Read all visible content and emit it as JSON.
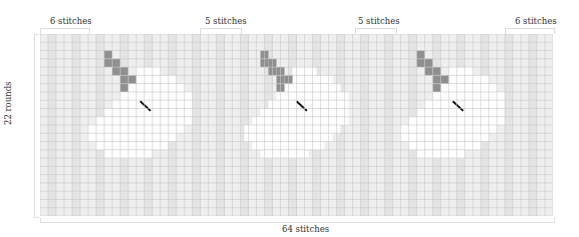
{
  "chart": {
    "columns": 64,
    "rows": 22,
    "column_label": "64 stitches",
    "row_label": "22 rounds",
    "top_brackets": [
      {
        "label": "6 stitches",
        "x": 40,
        "width": 48,
        "label_x": 50
      },
      {
        "label": "5 stitches",
        "x": 200,
        "width": 40,
        "label_x": 205
      },
      {
        "label": "5 stitches",
        "x": 355,
        "width": 40,
        "label_x": 358
      },
      {
        "label": "6 stitches",
        "x": 505,
        "width": 48,
        "label_x": 515
      }
    ],
    "colors": {
      "background_cell": "#efefef",
      "light_cell": "#e4e4e4",
      "white_cell": "#ffffff",
      "ear_cell": "#8f8f8f",
      "grid_line": "#c8c8c8",
      "stitch_mark": "#111111"
    },
    "motif_offsets": [
      0,
      19.5,
      39
    ],
    "ear_cells": [
      [
        8,
        2
      ],
      [
        8,
        3
      ],
      [
        9,
        3
      ],
      [
        9,
        4
      ],
      [
        10,
        4
      ],
      [
        10,
        5
      ],
      [
        11,
        5
      ],
      [
        10,
        6
      ]
    ],
    "stitch_mark": {
      "col": 12.5,
      "row": 8,
      "length_cells": 1.3
    },
    "white_cells_rows": [
      {
        "row": 4,
        "from": 12,
        "to": 14
      },
      {
        "row": 5,
        "from": 12,
        "to": 16
      },
      {
        "row": 6,
        "from": 11,
        "to": 17
      },
      {
        "row": 7,
        "from": 10,
        "to": 18
      },
      {
        "row": 8,
        "from": 9,
        "to": 18
      },
      {
        "row": 9,
        "from": 8,
        "to": 18
      },
      {
        "row": 10,
        "from": 7,
        "to": 18
      },
      {
        "row": 11,
        "from": 6,
        "to": 17
      },
      {
        "row": 12,
        "from": 6,
        "to": 16
      },
      {
        "row": 13,
        "from": 7,
        "to": 15
      },
      {
        "row": 14,
        "from": 8,
        "to": 13
      }
    ]
  },
  "chart_data": {
    "type": "heatmap",
    "title": "",
    "xlabel": "64 stitches",
    "ylabel": "22 rounds",
    "grid": true,
    "dimensions": {
      "columns": 64,
      "rows": 22
    },
    "annotations": [
      "6 stitches",
      "5 stitches",
      "5 stitches",
      "6 stitches"
    ],
    "motif_repeats": 3
  }
}
